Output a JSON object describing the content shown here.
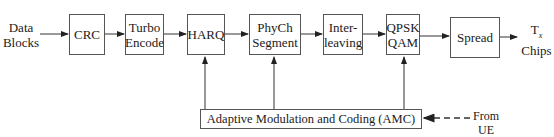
{
  "diagram": {
    "type": "block-diagram",
    "input_label": [
      "Data",
      "Blocks"
    ],
    "output_label": {
      "main": "T",
      "subscript": "x",
      "line2": "Chips"
    },
    "chain": [
      {
        "id": "crc",
        "lines": [
          "CRC"
        ]
      },
      {
        "id": "turbo",
        "lines": [
          "Turbo",
          "Encode"
        ]
      },
      {
        "id": "harq",
        "lines": [
          "HARQ"
        ]
      },
      {
        "id": "phych",
        "lines": [
          "PhyCh",
          "Segment"
        ]
      },
      {
        "id": "interleave",
        "lines": [
          "Inter-",
          "leaving"
        ]
      },
      {
        "id": "mod",
        "lines": [
          "QPSK",
          "QAM"
        ]
      },
      {
        "id": "spread",
        "lines": [
          "Spread"
        ]
      }
    ],
    "control_block": {
      "label": "Adaptive Modulation and Coding (AMC)",
      "feeds": [
        "harq",
        "phych",
        "mod"
      ]
    },
    "feedback_label": [
      "From",
      "UE"
    ],
    "feedback_style": "dashed-arrow"
  }
}
